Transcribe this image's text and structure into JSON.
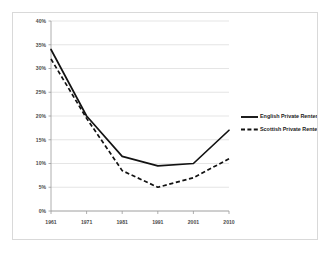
{
  "chart_data": {
    "type": "line",
    "title": "",
    "subtitle": "",
    "xlabel": "",
    "ylabel": "",
    "categories": [
      "1961",
      "1971",
      "1981",
      "1991",
      "2001",
      "2010"
    ],
    "x": [
      1961,
      1971,
      1981,
      1991,
      2001,
      2010
    ],
    "series": [
      {
        "name": "English Private Renters",
        "style": "solid",
        "color": "#121212",
        "values": [
          34,
          20,
          11.5,
          9.5,
          10,
          17
        ]
      },
      {
        "name": "Scottish Private Renters",
        "style": "dashed",
        "color": "#121212",
        "values": [
          32,
          19.5,
          8.5,
          5,
          7,
          11
        ]
      }
    ],
    "ylim": [
      0,
      40
    ],
    "ytick_step": 5,
    "ytick_labels": [
      "0%",
      "5%",
      "10%",
      "15%",
      "20%",
      "25%",
      "30%",
      "35%",
      "40%"
    ],
    "ytick_values": [
      0,
      5,
      10,
      15,
      20,
      25,
      30,
      35,
      40
    ],
    "xtick_labels": [
      "1961",
      "1971",
      "1981",
      "1991",
      "2001",
      "2010"
    ],
    "grid": true,
    "grid_axis": "y",
    "legend_position": "right",
    "legend": [
      {
        "label": "English Private Renters",
        "style": "solid"
      },
      {
        "label": "Scottish Private Renters",
        "style": "dashed"
      }
    ]
  },
  "colors": {
    "plot_background": "#ffffff",
    "frame_border": "#d9d9d9",
    "gridline": "#d4d4d4",
    "axis": "#9a9a9a",
    "tick_text": "#4a4a4a",
    "series_line": "#121212"
  }
}
